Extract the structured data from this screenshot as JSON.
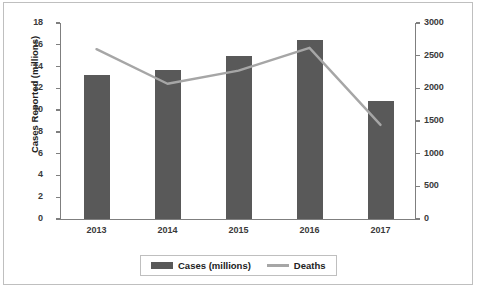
{
  "chart_data": {
    "type": "bar",
    "title": "",
    "subtitle": "",
    "xlabel": "",
    "ylabel": "Cases Reported (millions)",
    "y2label": "Number of Deaths",
    "categories": [
      "2013",
      "2014",
      "2015",
      "2016",
      "2017"
    ],
    "series": [
      {
        "name": "Cases (millions)",
        "type": "bar",
        "axis": "left",
        "color": "#595959",
        "values": [
          13.2,
          13.7,
          15.0,
          16.4,
          10.8
        ]
      },
      {
        "name": "Deaths",
        "type": "line",
        "axis": "right",
        "color": "#a6a6a6",
        "values": [
          2600,
          2070,
          2270,
          2620,
          1440
        ]
      }
    ],
    "ylim": [
      0,
      18
    ],
    "y2lim": [
      0,
      3000
    ],
    "yticks": [
      0,
      2,
      4,
      6,
      8,
      10,
      12,
      14,
      16,
      18
    ],
    "y2ticks": [
      0,
      500,
      1000,
      1500,
      2000,
      2500,
      3000
    ],
    "ytick_labels": [
      "0",
      "2",
      "4",
      "6",
      "8",
      "10",
      "12",
      "14",
      "16",
      "18"
    ],
    "y2tick_labels": [
      "0",
      "500",
      "1000",
      "1500",
      "2000",
      "2500",
      "3000"
    ],
    "grid": false,
    "legend_position": "bottom",
    "legend_entries": [
      "Cases (millions)",
      "Deaths"
    ],
    "plot_background": "#ffffff",
    "axis_color": "#7f7f7f",
    "border_color": "#bfbfbf"
  }
}
